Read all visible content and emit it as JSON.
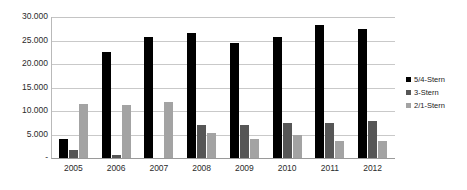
{
  "chart_data": {
    "type": "bar",
    "title": "",
    "xlabel": "",
    "ylabel": "",
    "categories": [
      "2005",
      "2006",
      "2007",
      "2008",
      "2009",
      "2010",
      "2011",
      "2012"
    ],
    "series": [
      {
        "name": "5/4-Stern",
        "color": "#000000",
        "values": [
          4000,
          22500,
          25700,
          26500,
          24500,
          25700,
          28300,
          27400
        ]
      },
      {
        "name": "3-Stern",
        "color": "#565656",
        "values": [
          1800,
          600,
          0,
          7000,
          7000,
          7500,
          7500,
          7800
        ]
      },
      {
        "name": "2/1-Stern",
        "color": "#a3a3a3",
        "values": [
          11500,
          11200,
          12000,
          5300,
          4100,
          5000,
          3700,
          3600
        ]
      }
    ],
    "ylim": [
      0,
      30000
    ],
    "yticks": [
      0,
      5000,
      10000,
      15000,
      20000,
      25000,
      30000
    ],
    "ytick_labels": [
      "-",
      "5.000",
      "10.000",
      "15.000",
      "20.000",
      "25.000",
      "30.000"
    ],
    "grid": true,
    "legend_position": "right",
    "legend": [
      "5/4-Stern",
      "3-Stern",
      "2/1-Stern"
    ]
  }
}
